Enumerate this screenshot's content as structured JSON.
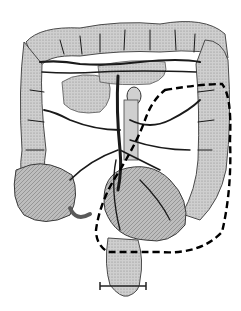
{
  "image": {
    "subject": "colon-vasculature-illustration",
    "style": "grayscale engraving",
    "width": 241,
    "height": 311,
    "colors": {
      "background": "#ffffff",
      "tissue_light": "#d9d9d9",
      "tissue_mid": "#a8a8a8",
      "tissue_dark": "#5a5a5a",
      "vessel": "#1a1a1a",
      "resection_line": "#000000"
    },
    "annotations": {
      "resection_outline": "dashed"
    }
  }
}
